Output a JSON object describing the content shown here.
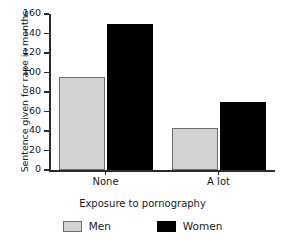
{
  "chart_data": {
    "type": "bar",
    "title": "",
    "xlabel": "Exposure to pornography",
    "ylabel": "Sentence given for rape in months",
    "categories": [
      "None",
      "A lot"
    ],
    "series": [
      {
        "name": "Men",
        "color": "#d2d2d2",
        "values": [
          95,
          43
        ]
      },
      {
        "name": "Women",
        "color": "#000000",
        "values": [
          150,
          70
        ]
      }
    ],
    "ylim": [
      0,
      160
    ],
    "yticks": [
      0,
      20,
      40,
      60,
      80,
      100,
      120,
      140,
      160
    ],
    "ytick_labels": [
      "0",
      "20",
      "40",
      "60",
      "80",
      "100",
      "120",
      "140",
      "160"
    ],
    "grid": false,
    "legend_position": "bottom",
    "legend_entries": [
      "Men",
      "Women"
    ]
  }
}
